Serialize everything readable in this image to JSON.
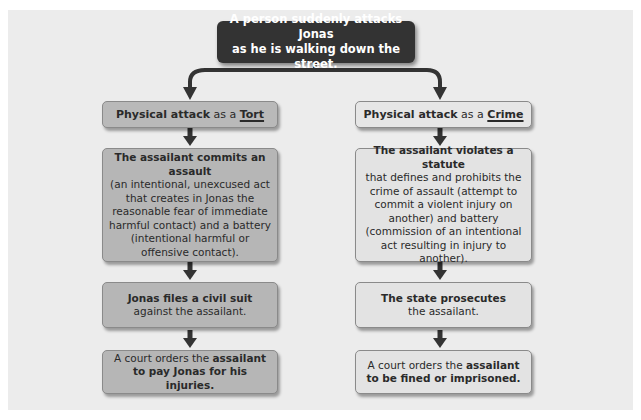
{
  "top": {
    "line1": "A person suddenly attacks Jonas",
    "line2": "as he is walking down the street."
  },
  "tort": {
    "header": {
      "bold": "Physical attack",
      "mid": " as a ",
      "term": "Tort"
    },
    "step1": {
      "bold": "The assailant commits an assault",
      "rest": "(an intentional, unexcused act that creates in Jonas the reasonable fear of immediate harmful contact) and a battery (intentional harmful or offensive contact)."
    },
    "step2": {
      "bold": "Jonas files a civil suit",
      "rest": " against the assailant."
    },
    "step3": {
      "pre": "A court orders the ",
      "bold": "assailant to pay Jonas for his injuries."
    }
  },
  "crime": {
    "header": {
      "bold": "Physical attack",
      "mid": " as a ",
      "term": "Crime"
    },
    "step1": {
      "bold": "The assailant violates a statute",
      "rest": "that defines and prohibits the crime of assault (attempt to commit a violent injury on another) and battery (commission of an intentional act resulting in injury to another)."
    },
    "step2": {
      "bold": "The state prosecutes",
      "rest": " the assailant."
    },
    "step3": {
      "pre": "A court orders the ",
      "bold": "assailant to be fined or imprisoned."
    }
  },
  "colors": {
    "top_box": "#333333",
    "tort_boxes": "#b6b6b6",
    "crime_boxes": "#e3e3e3",
    "arrows": "#333333",
    "background": "#ececec"
  }
}
